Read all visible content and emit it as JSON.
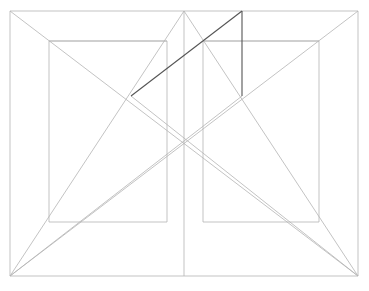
{
  "document": {
    "title": "Geometric Line Construction",
    "description": "Symmetric perspective construction drawing of nested rectangles with diagonals",
    "background_color": "#ffffff",
    "width": 369,
    "height": 291
  },
  "style": {
    "light_stroke_color": "#b4b4b4",
    "medium_stroke_color": "#a0a0a0",
    "dark_stroke_color": "#555555",
    "light_stroke_width": 0.8,
    "dark_stroke_width": 1.1
  },
  "geometry": {
    "outer_rect": {
      "label": "outer-frame-rectangle",
      "x1": 10,
      "y1": 11,
      "x2": 358,
      "y2": 276,
      "color": "#b4b4b4"
    },
    "left_inner_rect": {
      "label": "left-inner-rectangle",
      "x1": 49,
      "y1": 41,
      "x2": 167,
      "y2": 222,
      "color": "#b4b4b4"
    },
    "right_inner_rect": {
      "label": "right-inner-rectangle",
      "x1": 203,
      "y1": 41,
      "x2": 319,
      "y2": 222,
      "color": "#b4b4b4"
    },
    "center_vertical": {
      "label": "center-vertical-axis",
      "x1": 184,
      "y1": 11,
      "x2": 184,
      "y2": 276,
      "color": "#b4b4b4"
    },
    "apex_point": {
      "x": 184,
      "y": 11
    },
    "center_point": {
      "x": 184,
      "y": 144
    },
    "left_crossing_point": {
      "x": 131,
      "y": 96
    },
    "right_crossing_point": {
      "x": 242,
      "y": 96
    },
    "light_lines": [
      {
        "name": "diagonal-topleft-to-bottomright",
        "x1": 10,
        "y1": 11,
        "x2": 358,
        "y2": 276
      },
      {
        "name": "diagonal-topright-to-bottomleft",
        "x1": 358,
        "y1": 11,
        "x2": 10,
        "y2": 276
      },
      {
        "name": "apex-to-bottomleft",
        "x1": 184,
        "y1": 11,
        "x2": 10,
        "y2": 276
      },
      {
        "name": "apex-to-bottomright",
        "x1": 184,
        "y1": 11,
        "x2": 358,
        "y2": 276
      },
      {
        "name": "bottomleft-to-right-crossing",
        "x1": 10,
        "y1": 276,
        "x2": 242,
        "y2": 96
      },
      {
        "name": "bottomright-to-left-crossing",
        "x1": 358,
        "y1": 276,
        "x2": 131,
        "y2": 96
      },
      {
        "name": "left-inner-top-edge-extension",
        "x1": 49,
        "y1": 41,
        "x2": 167,
        "y2": 41
      },
      {
        "name": "right-inner-top-edge-extension",
        "x1": 203,
        "y1": 41,
        "x2": 319,
        "y2": 41
      }
    ],
    "dark_lines": [
      {
        "name": "highlight-diagonal",
        "x1": 131,
        "y1": 96,
        "x2": 242,
        "y2": 11
      },
      {
        "name": "highlight-vertical",
        "x1": 242,
        "y1": 11,
        "x2": 242,
        "y2": 96
      }
    ]
  }
}
